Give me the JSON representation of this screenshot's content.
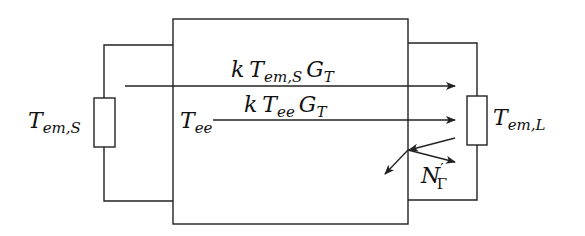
{
  "diagram": {
    "type": "two-port noise temperature model",
    "source_resistor_label": {
      "base": "T",
      "sub": "em,S"
    },
    "load_resistor_label": {
      "base": "T",
      "sub": "em,L"
    },
    "two_port_label": {
      "base": "T",
      "sub": "ee"
    },
    "upper_arrow_label": {
      "k": "k",
      "T": "T",
      "T_sub": "em,S",
      "G": "G",
      "G_sub": "T"
    },
    "lower_arrow_label": {
      "k": "k",
      "T": "T",
      "T_sub": "ee",
      "G": "G",
      "G_sub": "T"
    },
    "reflection_label": {
      "base": "N",
      "prime": "′",
      "sub": "Γ"
    }
  }
}
